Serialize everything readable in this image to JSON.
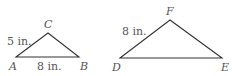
{
  "figure": {
    "triangle_abc": {
      "vertices": {
        "A": "A",
        "B": "B",
        "C": "C"
      },
      "side_ac_label": "5 in.",
      "side_ab_label": "8 in."
    },
    "triangle_def": {
      "vertices": {
        "D": "D",
        "E": "E",
        "F": "F"
      },
      "side_df_label": "8 in."
    },
    "line_color": "#333333"
  }
}
